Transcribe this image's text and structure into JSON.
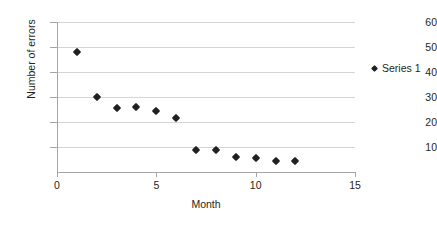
{
  "chart_data": {
    "type": "scatter",
    "title": "",
    "xlabel": "Month",
    "ylabel": "Number of errors",
    "xlim": [
      0,
      15
    ],
    "ylim": [
      0,
      60
    ],
    "grid": true,
    "legend_position": "right",
    "x_ticks": [
      "0",
      "5",
      "10",
      "15"
    ],
    "x_tick_values": [
      0,
      5,
      10,
      15
    ],
    "y_ticks": [
      "10",
      "20",
      "30",
      "40",
      "50",
      "60"
    ],
    "y_tick_values": [
      10,
      20,
      30,
      40,
      50,
      60
    ],
    "series": [
      {
        "name": "Series 1",
        "marker": "diamond",
        "color": "#231f20",
        "x": [
          1,
          2,
          3,
          4,
          5,
          6,
          7,
          8,
          9,
          10,
          11,
          12
        ],
        "values": [
          48,
          30,
          25.5,
          26,
          24.5,
          21.5,
          9,
          9,
          6,
          5.5,
          4.5,
          4.5
        ]
      }
    ]
  },
  "legend": {
    "entries": [
      {
        "label": "Series 1"
      }
    ]
  }
}
